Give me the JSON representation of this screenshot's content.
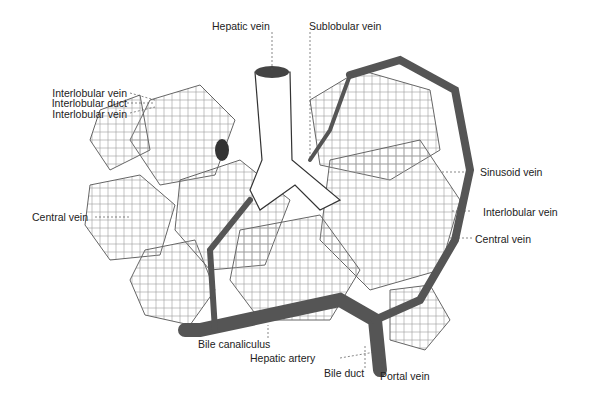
{
  "figure": {
    "labels": {
      "hepatic_vein": "Hepatic vein",
      "sublobular_vein": "Sublobular vein",
      "interlobular_vein_top": "Interlobular vein",
      "interlobular_duct": "Interlobular duct",
      "interlobular_vein_mid": "Interlobular vein",
      "central_vein_left": "Central vein",
      "sinusoid_vein": "Sinusoid vein",
      "interlobular_vein_right": "Interlobular vein",
      "central_vein_right": "Central vein",
      "bile_canaliculus": "Bile canaliculus",
      "hepatic_artery": "Hepatic artery",
      "bile_duct": "Bile duct",
      "portal_vein": "Portal vein"
    }
  }
}
